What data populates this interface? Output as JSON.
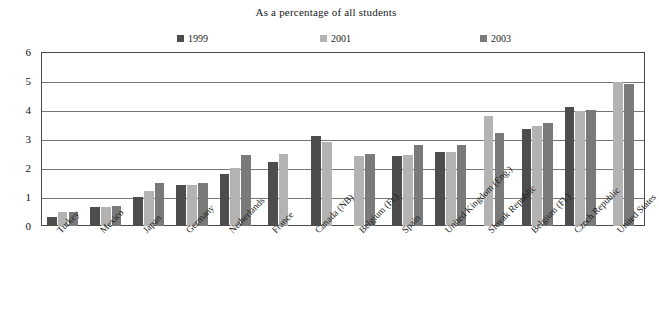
{
  "chart_data": {
    "type": "bar",
    "title": "As a percentage of all students",
    "subtitle": "",
    "xlabel": "",
    "ylabel": "",
    "ylim": [
      0,
      6
    ],
    "yticks": [
      0,
      1,
      2,
      3,
      4,
      5,
      6
    ],
    "grid": true,
    "legend_position": "top",
    "categories": [
      "Turkey",
      "Mexico",
      "Japan",
      "Germany",
      "Netherlands",
      "France",
      "Canada (NB)",
      "Belgium (Fr.)",
      "Spain",
      "United Kingdom (Eng.)",
      "Slovak Republic",
      "Belgium (Fl.)",
      "Czech Republic",
      "United States"
    ],
    "series": [
      {
        "name": "1999",
        "color": "#4d4d4d",
        "values": [
          0.3,
          0.65,
          1.0,
          1.4,
          1.8,
          2.2,
          3.1,
          null,
          2.4,
          2.55,
          null,
          3.35,
          4.1,
          null
        ]
      },
      {
        "name": "2001",
        "color": "#b3b3b3",
        "values": [
          0.5,
          0.65,
          1.2,
          1.4,
          2.0,
          2.5,
          2.9,
          2.4,
          2.45,
          2.55,
          3.8,
          3.45,
          3.95,
          4.95
        ]
      },
      {
        "name": "2003",
        "color": "#7a7a7a",
        "values": [
          0.5,
          0.7,
          1.5,
          1.5,
          2.45,
          null,
          null,
          2.5,
          2.8,
          2.8,
          3.2,
          3.55,
          4.0,
          4.9
        ]
      }
    ]
  }
}
